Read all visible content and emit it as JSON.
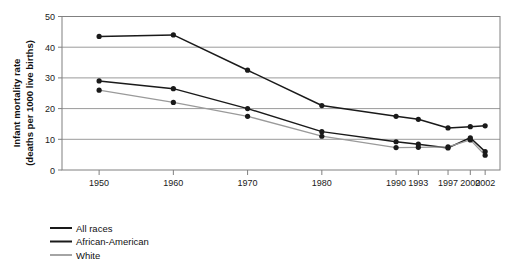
{
  "chart_data": {
    "type": "line",
    "title": "",
    "subtitle": "",
    "xlabel": "",
    "ylabel": "Infant mortality rate (deaths per 1000 live births)",
    "ylabel_line1": "Infant mortality rate",
    "ylabel_line2": "(deaths per 1000 live births)",
    "categories": [
      "1950",
      "1960",
      "1970",
      "1980",
      "1990",
      "1993",
      "1997",
      "2000",
      "2002"
    ],
    "x": [
      1950,
      1960,
      1970,
      1980,
      1990,
      1993,
      1997,
      2000,
      2002
    ],
    "xtick_labels": [
      "1950",
      "1960",
      "1970",
      "1980",
      "1990",
      "1993",
      "1997",
      "2000",
      "2002"
    ],
    "ytick_labels": [
      "0",
      "10",
      "20",
      "30",
      "40",
      "50"
    ],
    "yticks": [
      0,
      10,
      20,
      30,
      40,
      50
    ],
    "ylim": [
      0,
      50
    ],
    "xlim": [
      1945,
      2004
    ],
    "grid": "horizontal",
    "legend_position": "below-left",
    "series": [
      {
        "name": "All races",
        "color": "#1a1a1a",
        "values": [
          29.0,
          26.5,
          20.0,
          12.5,
          9.2,
          8.4,
          7.2,
          10.5,
          6.0
        ]
      },
      {
        "name": "African-American",
        "color": "#1a1a1a",
        "values": [
          43.5,
          44.0,
          32.5,
          21.0,
          17.5,
          16.5,
          13.7,
          14.1,
          14.4
        ]
      },
      {
        "name": "White",
        "color": "#9a9a9a",
        "values": [
          26.0,
          22.0,
          17.5,
          11.0,
          7.3,
          7.4,
          7.5,
          9.8,
          4.8
        ]
      }
    ]
  },
  "legend": {
    "items": [
      {
        "label": "All races",
        "color": "#1a1a1a"
      },
      {
        "label": "African-American",
        "color": "#1a1a1a"
      },
      {
        "label": "White",
        "color": "#9a9a9a"
      }
    ]
  },
  "colors": {
    "background": "#ffffff",
    "axis": "#808080",
    "gridline": "#9a9a9a",
    "plot_border": "#808080",
    "text": "#1a1a1a",
    "series_dark": "#1a1a1a",
    "series_light": "#9a9a9a"
  }
}
